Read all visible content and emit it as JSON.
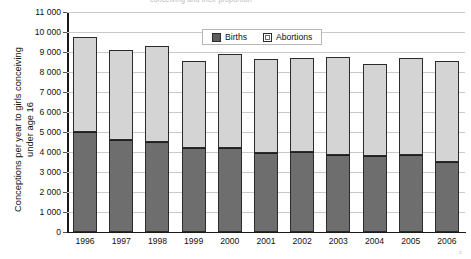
{
  "figure": {
    "top_title_fragment": "conceiving and their proportion",
    "corner_mark": "c"
  },
  "axes": {
    "y_title": "Conceptions per year to girls conceiving\nunder age 16",
    "y_tick_labels": [
      "11 000",
      "10 000",
      "9 000",
      "8 000",
      "7 000",
      "6 000",
      "5 000",
      "4 000",
      "3 000",
      "2 000",
      "1 000",
      "0"
    ],
    "x_tick_labels": [
      "1996",
      "1997",
      "1998",
      "1999",
      "2000",
      "2001",
      "2002",
      "2003",
      "2004",
      "2005",
      "2006"
    ]
  },
  "legend": {
    "position": "top-center-inside",
    "entries": [
      {
        "label": "Births",
        "swatch": "dark-gray-square"
      },
      {
        "label": "Abortions",
        "swatch": "light-gray-square"
      }
    ]
  },
  "colors": {
    "births": "#6e6e6e",
    "abortions": "#d4d4d4",
    "bar_outline": "#2b2b2b",
    "gridline": "#c9c9c9",
    "axis": "#1a1a1a",
    "background": "#ffffff"
  },
  "chart_data": {
    "type": "bar",
    "stacked": true,
    "title": "Conceptions per year to girls conceiving under age 16",
    "xlabel": "",
    "ylabel": "Conceptions per year to girls conceiving under age 16",
    "categories": [
      "1996",
      "1997",
      "1998",
      "1999",
      "2000",
      "2001",
      "2002",
      "2003",
      "2004",
      "2005",
      "2006"
    ],
    "series": [
      {
        "name": "Births",
        "color": "#6e6e6e",
        "values": [
          5000,
          4620,
          4520,
          4200,
          4200,
          3950,
          3980,
          3870,
          3800,
          3850,
          3520
        ]
      },
      {
        "name": "Abortions",
        "color": "#d4d4d4",
        "values": [
          4750,
          4470,
          4780,
          4370,
          4700,
          4680,
          4730,
          4880,
          4620,
          4830,
          5030
        ]
      }
    ],
    "totals": [
      9750,
      9090,
      9300,
      8570,
      8900,
      8630,
      8710,
      8750,
      8420,
      8680,
      8550
    ],
    "ylim": [
      0,
      11000
    ],
    "ytick_step": 1000,
    "grid": true,
    "legend_position": "top-center"
  }
}
